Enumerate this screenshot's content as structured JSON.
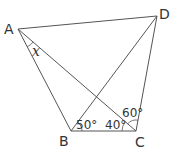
{
  "diagram": {
    "type": "geometry-quadrilateral",
    "vertices": [
      {
        "id": "A",
        "label": "A",
        "x": 18,
        "y": 29
      },
      {
        "id": "D",
        "label": "D",
        "x": 157,
        "y": 16
      },
      {
        "id": "B",
        "label": "B",
        "x": 71,
        "y": 131
      },
      {
        "id": "C",
        "label": "C",
        "x": 136,
        "y": 131
      }
    ],
    "segments": [
      [
        "A",
        "D"
      ],
      [
        "A",
        "B"
      ],
      [
        "B",
        "C"
      ],
      [
        "C",
        "D"
      ],
      [
        "A",
        "C"
      ],
      [
        "B",
        "D"
      ]
    ],
    "angles": [
      {
        "label": "50°",
        "at": "B",
        "between": [
          "C",
          "D"
        ]
      },
      {
        "label": "40°",
        "at": "C",
        "between": [
          "B",
          "A"
        ]
      },
      {
        "label": "60°",
        "at": "C",
        "between": [
          "A",
          "D"
        ]
      },
      {
        "label": "x",
        "at": "A",
        "between": [
          "B",
          "C"
        ],
        "unknown": true
      }
    ]
  },
  "labels": {
    "A": "A",
    "B": "B",
    "C": "C",
    "D": "D",
    "angle_B": "50°",
    "angle_C_lower": "40°",
    "angle_C_upper": "60°",
    "angle_x": "x"
  }
}
